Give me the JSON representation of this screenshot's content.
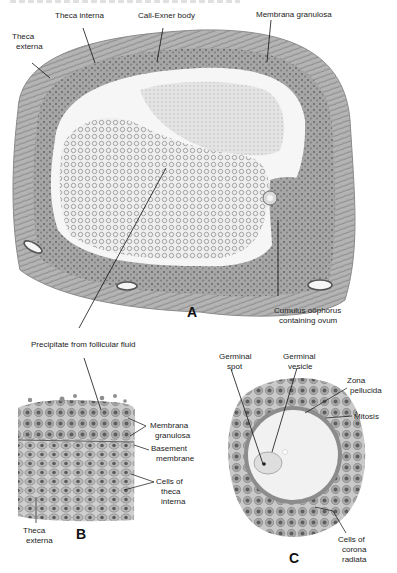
{
  "figure": {
    "panels": [
      {
        "id": "A",
        "letter": "A",
        "labels": {
          "theca_interna": "Theca interna",
          "call_exner_body": "Call-Exner body",
          "membrana_granulosa": "Membrana granulosa",
          "theca_externa_1": "Theca",
          "theca_externa_2": "externa",
          "cumulus_1": "Cumulus oöphorus",
          "cumulus_2": "containing ovum",
          "precipitate": "Precipitate from follicular fluid"
        }
      },
      {
        "id": "B",
        "letter": "B",
        "labels": {
          "membrana_1": "Membrana",
          "membrana_2": "granulosa",
          "basement_1": "Basement",
          "basement_2": "membrane",
          "cells_1": "Cells of",
          "cells_2": "theca",
          "cells_3": "interna",
          "theca_externa_1": "Theca",
          "theca_externa_2": "externa"
        }
      },
      {
        "id": "C",
        "letter": "C",
        "labels": {
          "germinal_spot_1": "Germinal",
          "germinal_spot_2": "spot",
          "germinal_vesicle_1": "Germinal",
          "germinal_vesicle_2": "vesicle",
          "zona_1": "Zona",
          "zona_2": "pellucida",
          "mitosis": "Mitosis",
          "corona_1": "Cells of",
          "corona_2": "corona",
          "corona_3": "radiata"
        }
      }
    ],
    "colors": {
      "tissue_dark": "#6e6e6e",
      "tissue_mid": "#9a9a9a",
      "tissue_light": "#c8c8c8",
      "fluid": "#f4f4f4",
      "ovum": "#f2f2f2",
      "zona": "#8a8a8a",
      "nucleus": "#555555"
    }
  }
}
